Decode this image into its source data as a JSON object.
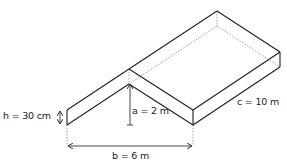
{
  "diagram": {
    "type": "isometric roof slab diagram",
    "colors": {
      "line": "#1f1f1f",
      "hidden_line": "#8a8a8a",
      "dimension": "#333333",
      "background": "#ffffff"
    },
    "labels": {
      "h": "h = 30 cm",
      "a": "a = 2 m",
      "b": "b = 6 m",
      "c": "c = 10 m"
    },
    "dimensions": [
      {
        "name": "h",
        "value": "30 cm",
        "description": "slab thickness"
      },
      {
        "name": "a",
        "value": "2 m",
        "description": "peak height"
      },
      {
        "name": "b",
        "value": "6 m",
        "description": "base width"
      },
      {
        "name": "c",
        "value": "10 m",
        "description": "depth"
      }
    ]
  }
}
